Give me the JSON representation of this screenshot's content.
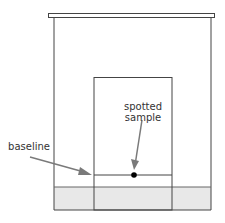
{
  "diagram": {
    "labels": {
      "spotted_sample_line1": "spotted",
      "spotted_sample_line2": "sample",
      "baseline": "baseline"
    },
    "colors": {
      "outline": "#444444",
      "solvent": "#e8e8e8",
      "arrow": "#7a7a7a",
      "spot": "#000000"
    }
  }
}
